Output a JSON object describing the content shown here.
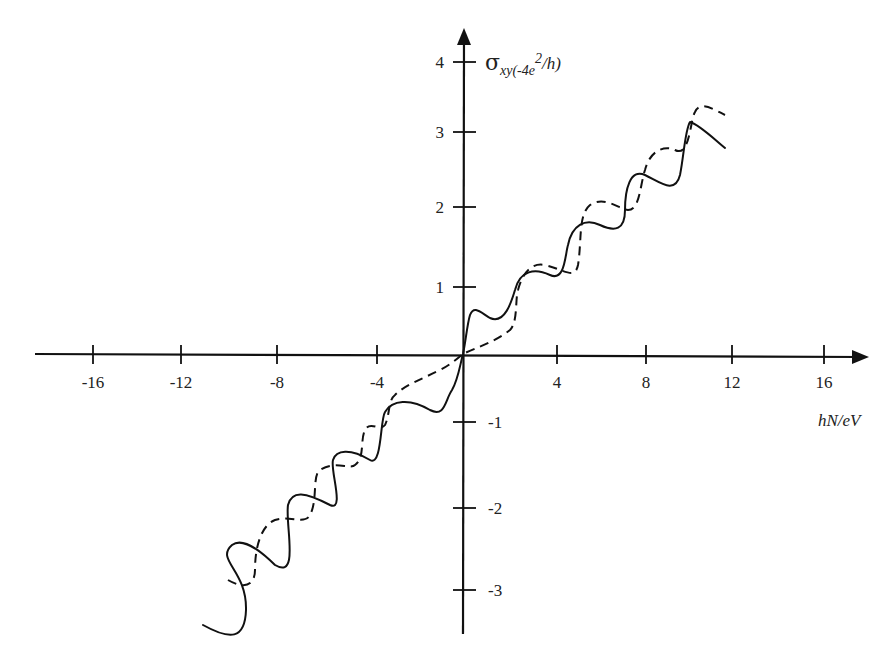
{
  "chart_data": {
    "type": "line",
    "title": "",
    "xlabel": "hN/eV",
    "ylabel": "σxy(-4e²/h)",
    "ylabel_parts": {
      "sigma": "σ",
      "sub": "xy(-4e",
      "sup": "2",
      "tail": "/h)"
    },
    "xlim": [
      -19,
      18
    ],
    "ylim": [
      -3.6,
      4.5
    ],
    "grid": false,
    "legend": null,
    "x_ticks": [
      -16,
      -12,
      -8,
      -4,
      4,
      8,
      12,
      16
    ],
    "x_tick_labels": [
      "-16",
      "-12",
      "-8",
      "-4",
      "4",
      "8",
      "12",
      "16"
    ],
    "y_ticks": [
      4,
      3,
      2,
      1,
      -1,
      -2,
      -3
    ],
    "y_tick_labels": [
      "4",
      "3",
      "2",
      "1",
      "-1",
      "-2",
      "-3"
    ],
    "series": [
      {
        "name": "solid",
        "style": "solid",
        "color": "#111111",
        "description": "Oscillating curve rising linearly with plateaus at roughly integer+0.5 steps",
        "x": [
          -11.7,
          -10.5,
          -10.2,
          -9.8,
          -8.8,
          -7.6,
          -7.0,
          -6.5,
          -5.6,
          -4.5,
          -3.7,
          -3.5,
          -2.8,
          -1.5,
          -0.8,
          -0.3,
          0,
          0.2,
          0.5,
          1.2,
          2.2,
          2.6,
          3.2,
          4.4,
          5.4,
          5.8,
          6.5,
          7.6,
          8.5,
          9.0,
          10.2,
          11.2
        ],
        "y": [
          -3.55,
          -3.45,
          -2.95,
          -2.45,
          -2.85,
          -2.05,
          -2.55,
          -1.95,
          -1.55,
          -1.95,
          -1.05,
          -0.85,
          -0.95,
          -0.8,
          -0.9,
          -0.5,
          0,
          0.5,
          0.6,
          0.45,
          0.45,
          1.15,
          0.75,
          1.35,
          1.55,
          2.0,
          1.6,
          2.25,
          2.65,
          3.15,
          2.85,
          2.7
        ]
      },
      {
        "name": "dashed",
        "style": "dashed",
        "color": "#111111",
        "description": "Step-like curve offset from the solid one, with plateaus at integer values",
        "x": [
          -10.5,
          -9.8,
          -9.4,
          -8.5,
          -7.4,
          -6.9,
          -5.6,
          -4.7,
          -4.0,
          -3.0,
          -2.4,
          -2.0,
          -0.5,
          0,
          1.0,
          2.0,
          2.6,
          3.5,
          4.6,
          5.5,
          6.6,
          7.3,
          8.6,
          9.7,
          11.0
        ],
        "y": [
          -2.9,
          -2.95,
          -2.6,
          -2.05,
          -2.1,
          -1.55,
          -1.1,
          -1.25,
          -0.85,
          -1.05,
          -0.35,
          -0.25,
          -0.05,
          0,
          0.15,
          0.3,
          1.05,
          1.15,
          0.95,
          1.75,
          2.05,
          1.75,
          2.45,
          3.35,
          3.1
        ]
      }
    ]
  },
  "plot": {
    "origin_px": [
      463,
      354
    ],
    "x_scale_px_per_unit": 22.5,
    "y_scale_px_per_unit": 77,
    "solid_path": "M 203 625 C 230 640, 245 640, 246 610 C 247 570, 215 560, 232 545 C 245 535, 270 560, 275 565 C 300 580, 285 525, 288 505 C 292 490, 305 492, 330 505 C 345 512, 330 470, 333 460 C 336 450, 350 448, 370 460 C 382 467, 380 420, 385 412 C 392 400, 410 398, 430 410 C 445 418, 445 400, 452 390 C 458 380, 460 365, 463 354 C 466 340, 467 325, 470 315 C 474 305, 480 312, 490 318 C 505 325, 512 300, 515 290 C 520 270, 535 268, 550 275 C 565 282, 565 255, 568 245 C 572 225, 585 218, 600 225 C 615 232, 625 230, 625 210 C 625 190, 630 168, 645 175 C 660 182, 675 195, 680 175 C 684 155, 685 130, 690 122 C 700 125, 715 140, 725 148",
    "dashed_path": "M 228 580 C 245 590, 255 585, 255 570 C 255 545, 262 525, 275 520 C 290 515, 305 525, 310 515 C 318 500, 312 475, 320 470 C 335 460, 350 470, 355 465 C 365 458, 360 440, 365 430 C 370 420, 380 432, 385 425 C 390 415, 388 400, 395 395 C 405 385, 420 380, 440 370 C 450 365, 458 358, 463 354 C 475 348, 495 342, 510 330 C 518 322, 515 300, 518 290 C 522 275, 530 262, 545 265 C 565 270, 575 280, 578 265 C 582 240, 578 215, 590 205 C 605 195, 620 210, 628 210 C 640 210, 640 185, 645 170 C 650 150, 665 145, 675 150 C 690 158, 690 120, 695 112 C 700 100, 715 110, 725 115"
  }
}
